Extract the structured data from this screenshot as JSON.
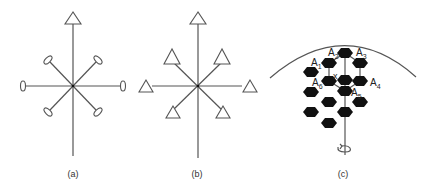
{
  "panels": [
    {
      "id": "a",
      "caption": "(a)",
      "center": [
        73,
        86
      ],
      "end_marker": "ellipse",
      "top_marker": "triangle"
    },
    {
      "id": "b",
      "caption": "(b)",
      "center": [
        198,
        86
      ],
      "end_marker": "triangle",
      "top_marker": "triangle"
    },
    {
      "id": "c",
      "caption": "(c)",
      "center_label": "x",
      "atom_labels": [
        {
          "main": "A",
          "sub": "1"
        },
        {
          "main": "A",
          "sub": "2"
        },
        {
          "main": "A",
          "sub": "3"
        },
        {
          "main": "A",
          "sub": "4"
        },
        {
          "main": "A",
          "sub": "5"
        },
        {
          "main": "A",
          "sub": "6"
        }
      ],
      "rotation_symbol": "rotation-arrow"
    }
  ],
  "colors": {
    "line": "#555555",
    "hexagon": "#111111",
    "background": "#ffffff"
  }
}
